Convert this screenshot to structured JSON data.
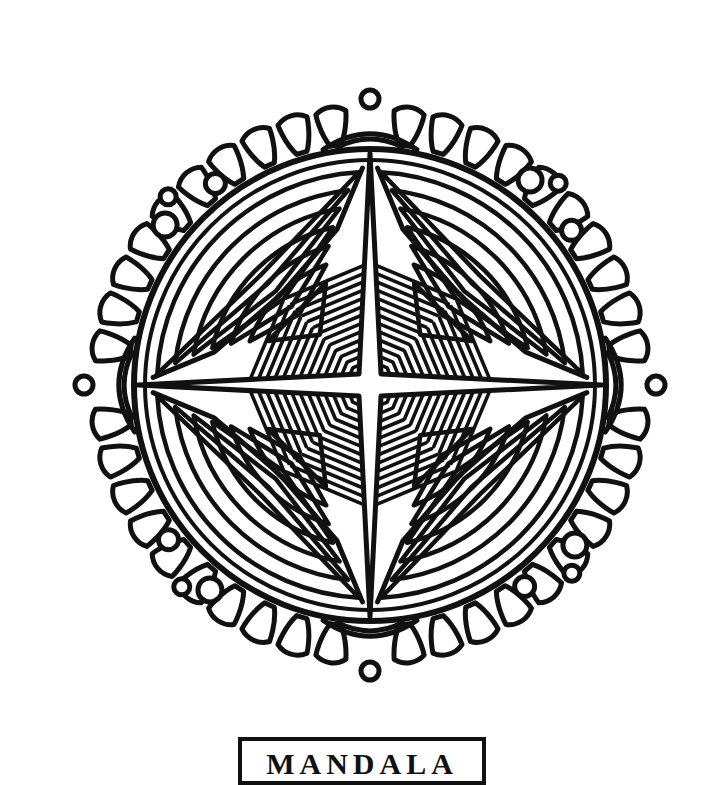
{
  "page": {
    "background_color": "#ffffff",
    "ink_color": "#111111",
    "width": 718,
    "height": 762
  },
  "frame": {
    "name": "page-border",
    "stroke_color": "#111111",
    "stroke_width": 3
  },
  "caption": {
    "text": "MANDALA",
    "box_stroke_color": "#111111",
    "box_stroke_width": 4,
    "note": "caption box is cropped by the bottom edge of the screenshot; only the tops of the letters are visible"
  },
  "artwork": {
    "name": "mandala",
    "style": "line-art coloring page, black outlines on white",
    "symmetry": "4-fold radial with mirror axes",
    "center": {
      "x": 334,
      "y": 349
    },
    "geometry": {
      "inner_circle_radius": 236,
      "petal_ring_inner_radius": 238,
      "petal_ring_outer_radius": 296,
      "petal_count": 44,
      "petal_width_deg": 6.3,
      "corner_dot_count": 12,
      "chevron_rings_per_quadrant": 6,
      "hatch_lines_per_octant": 13,
      "center_cross_arm_length": 232,
      "center_cross_half_width": 11
    },
    "elements": [
      {
        "name": "outer-petal-ring",
        "description": "ring of elongated teardrop petals radiating outward"
      },
      {
        "name": "corner-dot-cluster",
        "description": "small circles clustered at the 45 degree diagonal corners"
      },
      {
        "name": "inner-circle",
        "description": "large circle enclosing the four quadrant panels"
      },
      {
        "name": "chevron-triangle-motif",
        "description": "nested concentric triangles in each quadrant corner"
      },
      {
        "name": "hatch-panel",
        "description": "parallel diagonal hatching lines filling the inner octant wedges"
      },
      {
        "name": "center-cross",
        "description": "four-pointed star cross at the exact center"
      },
      {
        "name": "petal-junction-dot",
        "description": "small circle and arch at each axis junction of the petal ring"
      }
    ]
  }
}
